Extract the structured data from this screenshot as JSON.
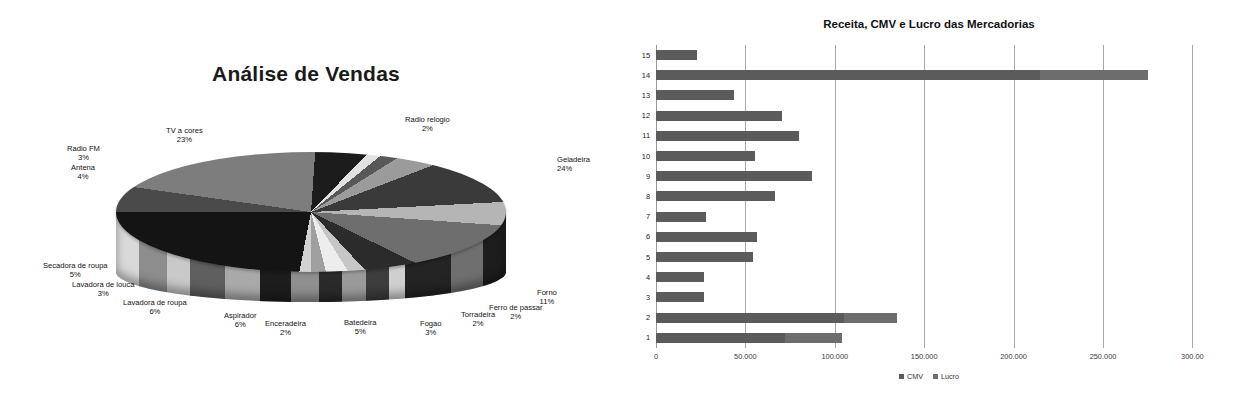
{
  "pie": {
    "title": "Análise de Vendas",
    "labels": [
      {
        "name": "TV a cores",
        "pct": "23%"
      },
      {
        "name": "Radio relogio",
        "pct": "2%"
      },
      {
        "name": "Geladeira",
        "pct": "24%"
      },
      {
        "name": "Radio FM",
        "pct": "3%"
      },
      {
        "name": "Antena",
        "pct": "4%"
      },
      {
        "name": "Secadora de roupa",
        "pct": "5%"
      },
      {
        "name": "Lavadora de louca",
        "pct": "3%"
      },
      {
        "name": "Lavadora de roupa",
        "pct": "6%"
      },
      {
        "name": "Aspirador",
        "pct": "6%"
      },
      {
        "name": "Enceradeira",
        "pct": "2%"
      },
      {
        "name": "Batedeira",
        "pct": "5%"
      },
      {
        "name": "Fogao",
        "pct": "3%"
      },
      {
        "name": "Torradeira",
        "pct": "2%"
      },
      {
        "name": "Ferro de passar",
        "pct": "2%"
      },
      {
        "name": "Forno",
        "pct": "11%"
      }
    ]
  },
  "bar": {
    "title": "Receita, CMV e Lucro das Mercadorias",
    "xticks": [
      "0",
      "50.000",
      "100.000",
      "150.000",
      "200.000",
      "250.000",
      "300.00"
    ],
    "legend": [
      {
        "label": "CMV",
        "color": "#5b5b5b"
      },
      {
        "label": "Lucro",
        "color": "#6d6d6d"
      }
    ],
    "yticks": [
      "15",
      "14",
      "13",
      "12",
      "11",
      "10",
      "9",
      "8",
      "7",
      "6",
      "5",
      "4",
      "3",
      "2",
      "1"
    ]
  },
  "chart_data": [
    {
      "type": "pie",
      "title": "Análise de Vendas",
      "categories": [
        "TV a cores",
        "Radio relogio",
        "Geladeira",
        "Forno",
        "Ferro de passar",
        "Torradeira",
        "Fogao",
        "Batedeira",
        "Enceradeira",
        "Aspirador",
        "Lavadora de roupa",
        "Lavadora de louca",
        "Secadora de roupa",
        "Antena",
        "Radio FM"
      ],
      "values": [
        23,
        2,
        24,
        11,
        2,
        2,
        3,
        5,
        2,
        6,
        6,
        3,
        5,
        4,
        3
      ],
      "unit": "percent",
      "labels_shown": "name + percent",
      "legend": "none (labels around slices)",
      "style": "3D exploded-free pie, grayscale"
    },
    {
      "type": "bar",
      "orientation": "horizontal",
      "stacked": true,
      "title": "Receita, CMV e Lucro das Mercadorias",
      "categories": [
        "1",
        "2",
        "3",
        "4",
        "5",
        "6",
        "7",
        "8",
        "9",
        "10",
        "11",
        "12",
        "13",
        "14",
        "15"
      ],
      "series": [
        {
          "name": "CMV",
          "values": [
            72000,
            105000,
            26700,
            27000,
            54500,
            56700,
            28000,
            66400,
            87300,
            55200,
            80200,
            70500,
            43800,
            215000,
            23000
          ]
        },
        {
          "name": "Lucro",
          "values": [
            32000,
            30000,
            0,
            0,
            0,
            0,
            0,
            0,
            0,
            0,
            0,
            0,
            0,
            60000,
            0
          ]
        }
      ],
      "totals": [
        104000,
        135000,
        26700,
        27000,
        54500,
        56700,
        28000,
        66400,
        87300,
        55200,
        80200,
        70500,
        43800,
        275000,
        23000
      ],
      "xlabel": "",
      "ylabel": "",
      "xlim": [
        0,
        300000
      ],
      "xticks": [
        0,
        50000,
        100000,
        150000,
        200000,
        250000,
        300000
      ],
      "xtick_labels": [
        "0",
        "50.000",
        "100.000",
        "150.000",
        "200.000",
        "250.000",
        "300.00"
      ],
      "grid": "vertical gridlines only",
      "legend_position": "bottom-center"
    }
  ]
}
